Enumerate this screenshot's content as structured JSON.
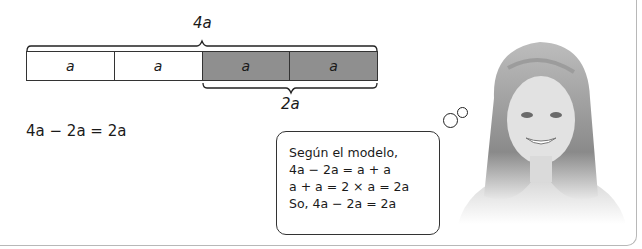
{
  "bar_model": {
    "total_label": "4a",
    "part_label": "2a",
    "segments": [
      {
        "label": "a",
        "shaded": false
      },
      {
        "label": "a",
        "shaded": false
      },
      {
        "label": "a",
        "shaded": true
      },
      {
        "label": "a",
        "shaded": true
      }
    ]
  },
  "equation": "4a − 2a = 2a",
  "thought_bubble": {
    "lines": [
      "Según el modelo,",
      "4a − 2a = a + a",
      "a + a = 2 × a = 2a",
      "So, 4a − 2a = 2a"
    ]
  },
  "illustration": "girl-photo"
}
